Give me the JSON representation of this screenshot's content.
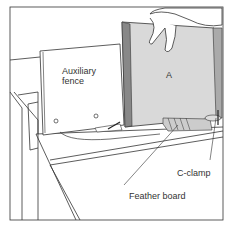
{
  "diagram": {
    "labels": {
      "auxiliary_fence_line1": "Auxiliary",
      "auxiliary_fence_line2": "fence",
      "workpiece": "A",
      "c_clamp": "C-clamp",
      "feather_board": "Feather board"
    },
    "colors": {
      "line": "#333333",
      "workpiece_fill": "#d9d9d9",
      "fence_fill": "#ffffff",
      "background": "#ffffff"
    }
  }
}
